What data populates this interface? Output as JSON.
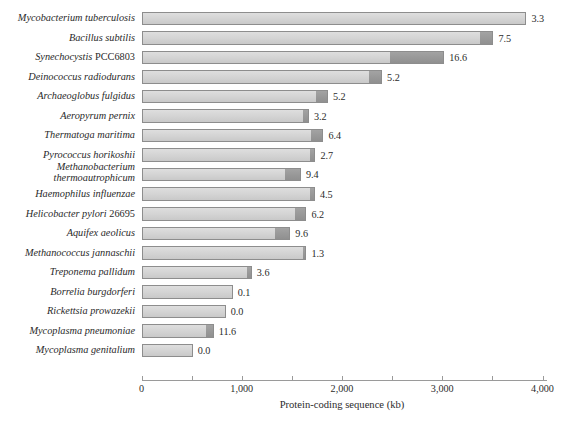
{
  "chart_data": {
    "type": "bar",
    "orientation": "horizontal",
    "stacked": true,
    "title": "",
    "xlabel": "Protein-coding sequence (kb)",
    "ylabel": "",
    "xlim": [
      0,
      4000
    ],
    "xticks": [
      0,
      500,
      1000,
      1500,
      2000,
      2500,
      3000,
      3500,
      4000
    ],
    "xtick_labels": [
      "0",
      "",
      "1,000",
      "",
      "2,000",
      "",
      "3,000",
      "",
      "4,000"
    ],
    "grid": false,
    "legend": null,
    "series": [
      {
        "name": "coding",
        "color": "#d6d6d6"
      },
      {
        "name": "non-coding",
        "color": "#9a9a9a"
      }
    ],
    "categories": [
      "Mycobacterium tuberculosis",
      "Bacillus subtilis",
      "Synechocystis PCC6803",
      "Deinococcus radiodurans",
      "Archaeoglobus fulgidus",
      "Aeropyrum pernix",
      "Thermatoga maritima",
      "Pyrococcus horikoshii",
      "Methanobacterium thermoautrophicum",
      "Haemophilus influenzae",
      "Helicobacter pylori 26695",
      "Aquifex aeolicus",
      "Methanococcus jannaschii",
      "Treponema pallidum",
      "Borrelia burgdorferi",
      "Rickettsia prowazekii",
      "Mycoplasma pneumoniae",
      "Mycoplasma genitalium"
    ],
    "rows": [
      {
        "label": "Mycobacterium tuberculosis",
        "label_lines": [
          "Mycobacterium tuberculosis"
        ],
        "italic_part": "Mycobacterium tuberculosis",
        "upright_part": "",
        "coding": 3840,
        "noncoding": 0,
        "total": 3840,
        "value_label": "3.3"
      },
      {
        "label": "Bacillus subtilis",
        "label_lines": [
          "Bacillus subtilis"
        ],
        "italic_part": "Bacillus subtilis",
        "upright_part": "",
        "coding": 3390,
        "noncoding": 120,
        "total": 3510,
        "value_label": "7.5"
      },
      {
        "label": "Synechocystis PCC6803",
        "label_lines": [
          "Synechocystis PCC6803"
        ],
        "italic_part": "Synechocystis",
        "upright_part": "PCC6803",
        "coding": 2490,
        "noncoding": 530,
        "total": 3020,
        "value_label": "16.6"
      },
      {
        "label": "Deinococcus radiodurans",
        "label_lines": [
          "Deinococcus radiodurans"
        ],
        "italic_part": "Deinococcus radiodurans",
        "upright_part": "",
        "coding": 2280,
        "noncoding": 120,
        "total": 2400,
        "value_label": "5.2"
      },
      {
        "label": "Archaeoglobus fulgidus",
        "label_lines": [
          "Archaeoglobus fulgidus"
        ],
        "italic_part": "Archaeoglobus fulgidus",
        "upright_part": "",
        "coding": 1750,
        "noncoding": 110,
        "total": 1860,
        "value_label": "5.2"
      },
      {
        "label": "Aeropyrum pernix",
        "label_lines": [
          "Aeropyrum pernix"
        ],
        "italic_part": "Aeropyrum pernix",
        "upright_part": "",
        "coding": 1620,
        "noncoding": 50,
        "total": 1670,
        "value_label": "3.2"
      },
      {
        "label": "Thermatoga maritima",
        "label_lines": [
          "Thermatoga maritima"
        ],
        "italic_part": "Thermatoga maritima",
        "upright_part": "",
        "coding": 1700,
        "noncoding": 115,
        "total": 1815,
        "value_label": "6.4"
      },
      {
        "label": "Pyrococcus horikoshii",
        "label_lines": [
          "Pyrococcus horikoshii"
        ],
        "italic_part": "Pyrococcus horikoshii",
        "upright_part": "",
        "coding": 1690,
        "noncoding": 45,
        "total": 1735,
        "value_label": "2.7"
      },
      {
        "label": "Methanobacterium thermoautrophicum",
        "label_lines": [
          "Methanobacterium",
          "thermoautrophicum"
        ],
        "italic_part": "Methanobacterium thermoautrophicum",
        "upright_part": "",
        "coding": 1445,
        "noncoding": 145,
        "total": 1590,
        "value_label": "9.4"
      },
      {
        "label": "Haemophilus influenzae",
        "label_lines": [
          "Haemophilus influenzae"
        ],
        "italic_part": "Haemophilus influenzae",
        "upright_part": "",
        "coding": 1690,
        "noncoding": 40,
        "total": 1730,
        "value_label": "4.5"
      },
      {
        "label": "Helicobacter pylori 26695",
        "label_lines": [
          "Helicobacter pylori 26695"
        ],
        "italic_part": "Helicobacter pylori",
        "upright_part": "26695",
        "coding": 1540,
        "noncoding": 105,
        "total": 1645,
        "value_label": "6.2"
      },
      {
        "label": "Aquifex aeolicus",
        "label_lines": [
          "Aquifex aeolicus"
        ],
        "italic_part": "Aquifex aeolicus",
        "upright_part": "",
        "coding": 1340,
        "noncoding": 145,
        "total": 1485,
        "value_label": "9.6"
      },
      {
        "label": "Methanococcus jannaschii",
        "label_lines": [
          "Methanococcus jannaschii"
        ],
        "italic_part": "Methanococcus jannaschii",
        "upright_part": "",
        "coding": 1620,
        "noncoding": 25,
        "total": 1645,
        "value_label": "1.3"
      },
      {
        "label": "Treponema pallidum",
        "label_lines": [
          "Treponema pallidum"
        ],
        "italic_part": "Treponema pallidum",
        "upright_part": "",
        "coding": 1060,
        "noncoding": 40,
        "total": 1100,
        "value_label": "3.6"
      },
      {
        "label": "Borrelia burgdorferi",
        "label_lines": [
          "Borrelia burgdorferi"
        ],
        "italic_part": "Borrelia burgdorferi",
        "upright_part": "",
        "coding": 910,
        "noncoding": 0,
        "total": 910,
        "value_label": "0.1"
      },
      {
        "label": "Rickettsia prowazekii",
        "label_lines": [
          "Rickettsia prowazekii"
        ],
        "italic_part": "Rickettsia prowazekii",
        "upright_part": "",
        "coding": 840,
        "noncoding": 0,
        "total": 840,
        "value_label": "0.0"
      },
      {
        "label": "Mycoplasma pneumoniae",
        "label_lines": [
          "Mycoplasma pneumoniae"
        ],
        "italic_part": "Mycoplasma pneumoniae",
        "upright_part": "",
        "coding": 655,
        "noncoding": 65,
        "total": 720,
        "value_label": "11.6"
      },
      {
        "label": "Mycoplasma genitalium",
        "label_lines": [
          "Mycoplasma genitalium"
        ],
        "italic_part": "Mycoplasma genitalium",
        "upright_part": "",
        "coding": 510,
        "noncoding": 0,
        "total": 510,
        "value_label": "0.0"
      }
    ]
  }
}
